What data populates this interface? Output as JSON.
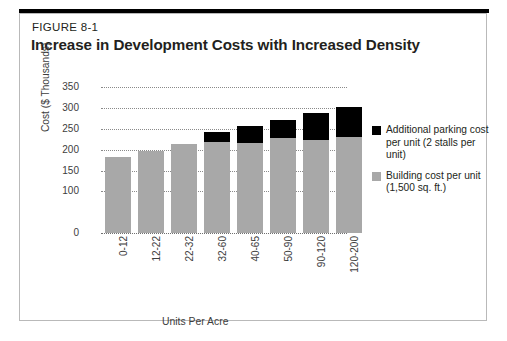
{
  "figure": {
    "number": "FIGURE 8-1",
    "title": "Increase in Development Costs with Increased Density"
  },
  "legend": {
    "items": [
      {
        "label": "Additional parking cost per unit (2 stalls per unit)",
        "color": "#000000",
        "swatch_name": "legend-swatch-parking"
      },
      {
        "label": "Building cost per unit (1,500 sq. ft.)",
        "color": "#a8a8a8",
        "swatch_name": "legend-swatch-building"
      }
    ]
  },
  "axes": {
    "ylabel": "Cost ($ Thousands)",
    "xlabel": "Units Per Acre",
    "yticks": [
      "350",
      "300",
      "250",
      "200",
      "150",
      "100",
      "0"
    ],
    "ytick_values": [
      350,
      300,
      250,
      200,
      150,
      100,
      0
    ]
  },
  "chart_data": {
    "type": "bar",
    "subtype": "stacked-vertical",
    "title": "Increase in Development Costs with Increased Density",
    "subtitle": "FIGURE 8-1",
    "xlabel": "Units Per Acre",
    "ylabel": "Cost ($ Thousands)",
    "ylim": [
      0,
      360
    ],
    "ytick_labels": [
      "0",
      "100",
      "150",
      "200",
      "250",
      "300",
      "350"
    ],
    "grid": "horizontal-dotted",
    "legend_position": "right",
    "categories": [
      "0-12",
      "12-22",
      "22-32",
      "32-60",
      "40-65",
      "50-90",
      "90-120",
      "120-200"
    ],
    "series": [
      {
        "name": "Building cost per unit (1,500 sq. ft.)",
        "color": "#a8a8a8",
        "values": [
          183,
          197,
          213,
          218,
          215,
          228,
          224,
          230
        ]
      },
      {
        "name": "Additional parking cost per unit (2 stalls per unit)",
        "color": "#000000",
        "values": [
          0,
          0,
          0,
          24,
          43,
          44,
          64,
          72
        ]
      }
    ],
    "totals": [
      183,
      197,
      213,
      242,
      258,
      272,
      288,
      302
    ]
  }
}
